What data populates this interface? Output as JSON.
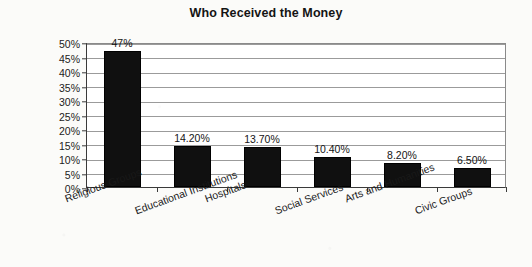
{
  "chart_data": {
    "type": "bar",
    "title": "Who Received the Money",
    "xlabel": "",
    "ylabel": "Percent",
    "ylim": [
      0,
      50
    ],
    "ytick_step": 5,
    "ytick_labels": [
      "0%",
      "5%",
      "10%",
      "15%",
      "20%",
      "25%",
      "30%",
      "35%",
      "40%",
      "45%",
      "50%"
    ],
    "grid": "horizontal",
    "legend": "none",
    "bar_color": "#101010",
    "categories": [
      "Religious Groups",
      "Educational Institutions",
      "Hospitals",
      "Social Services",
      "Arts and Humanities",
      "Civic Groups"
    ],
    "values": [
      47,
      14.2,
      13.7,
      10.4,
      8.2,
      6.5
    ],
    "data_labels": [
      "47%",
      "14.20%",
      "13.70%",
      "10.40%",
      "8.20%",
      "6.50%"
    ]
  }
}
